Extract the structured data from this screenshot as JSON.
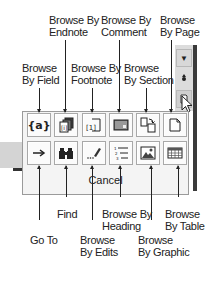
{
  "callouts": {
    "browse_by_field": "Browse\nBy Field",
    "browse_by_endnote": "Browse By\nEndnote",
    "browse_by_footnote": "Browse By\nFootnote",
    "browse_by_comment": "Browse By\nComment",
    "browse_by_section": "Browse\nBy Section",
    "browse_by_page": "Browse\nBy Page",
    "go_to": "Go To",
    "find": "Find",
    "browse_by_edits": "Browse\nBy Edits",
    "browse_by_heading": "Browse By\nHeading",
    "browse_by_graphic": "Browse\nBy Graphic",
    "browse_by_table": "Browse\nBy Table"
  },
  "panel": {
    "row1": [
      {
        "name": "browse-by-field",
        "icon": "field-braces-icon",
        "glyph": "{a}"
      },
      {
        "name": "browse-by-endnote",
        "icon": "endnote-stack-icon",
        "glyph": "[i]"
      },
      {
        "name": "browse-by-footnote",
        "icon": "footnote-icon",
        "glyph": "[1]"
      },
      {
        "name": "browse-by-comment",
        "icon": "comment-icon",
        "glyph": ""
      },
      {
        "name": "browse-by-section",
        "icon": "section-icon",
        "glyph": ""
      },
      {
        "name": "browse-by-page",
        "icon": "page-icon",
        "glyph": ""
      }
    ],
    "row2": [
      {
        "name": "go-to",
        "icon": "arrow-right-icon",
        "glyph": "→"
      },
      {
        "name": "find",
        "icon": "binoculars-icon",
        "glyph": ""
      },
      {
        "name": "browse-by-edits",
        "icon": "pencil-edit-icon",
        "glyph": ""
      },
      {
        "name": "browse-by-heading",
        "icon": "numbered-list-icon",
        "glyph": ""
      },
      {
        "name": "browse-by-graphic",
        "icon": "picture-icon",
        "glyph": ""
      },
      {
        "name": "browse-by-table",
        "icon": "table-icon",
        "glyph": ""
      }
    ],
    "cancel_label": "Cancel"
  },
  "scrollbar": {
    "down_glyph": "▼",
    "browse_object_glyph": "●"
  }
}
